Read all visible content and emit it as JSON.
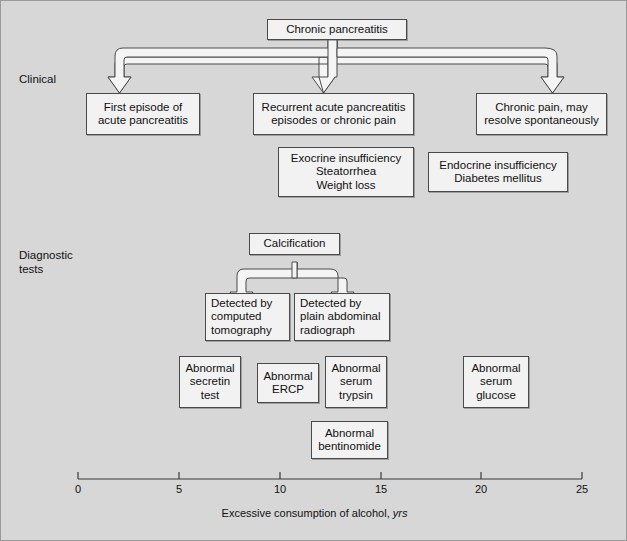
{
  "figure": {
    "background_color": "#d7d7d7",
    "box_fill": "#f2f2f2",
    "line_color": "#4a4a4a"
  },
  "row_labels": {
    "clinical": "Clinical",
    "diagnostic": "Diagnostic\ntests"
  },
  "nodes": {
    "root": {
      "line1": "Chronic pancreatitis"
    },
    "clinical_1": {
      "line1": "First episode of",
      "line2": "acute pancreatitis"
    },
    "clinical_2": {
      "line1": "Recurrent acute pancreatitis",
      "line2": "episodes or chronic pain"
    },
    "clinical_3": {
      "line1": "Chronic pain, may",
      "line2": "resolve spontaneously"
    },
    "exocrine": {
      "line1": "Exocrine  insufficiency",
      "line2": "Steatorrhea",
      "line3": "Weight loss"
    },
    "endocrine": {
      "line1": "Endocrine  insufficiency",
      "line2": "Diabetes mellitus"
    },
    "calcification": {
      "line1": "Calcification"
    },
    "detected_ct": {
      "line1": "Detected by",
      "line2": "computed",
      "line3": "tomography"
    },
    "detected_xray": {
      "line1": "Detected by",
      "line2": "plain abdominal",
      "line3": "radiograph"
    },
    "secretin": {
      "line1": "Abnormal",
      "line2": "secretin",
      "line3": "test"
    },
    "ercp": {
      "line1": "Abnormal",
      "line2": "ERCP"
    },
    "trypsin": {
      "line1": "Abnormal",
      "line2": "serum",
      "line3": "trypsin"
    },
    "glucose": {
      "line1": "Abnormal",
      "line2": "serum",
      "line3": "glucose"
    },
    "bentinomide": {
      "line1": "Abnormal",
      "line2": "bentinomide"
    }
  },
  "axis": {
    "title_main": "Excessive consumption of alcohol,",
    "title_units": "yrs",
    "ticks": [
      "0",
      "5",
      "10",
      "15",
      "20",
      "25"
    ],
    "min": 0,
    "max": 25
  }
}
